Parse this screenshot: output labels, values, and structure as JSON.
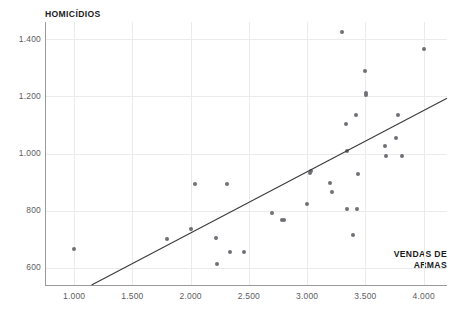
{
  "chart_data": {
    "type": "scatter",
    "title": "",
    "xlabel": "VENDAS DE ARMAS",
    "ylabel": "HOMICÍDIOS",
    "xlabel_lines": [
      "VENDAS DE",
      "ARMAS"
    ],
    "grid": true,
    "legend": false,
    "xlim": [
      750,
      4200
    ],
    "ylim": [
      540,
      1460
    ],
    "xticks": [
      1000,
      1500,
      2000,
      2500,
      3000,
      3500,
      4000
    ],
    "xtick_labels": [
      "1.000",
      "1.500",
      "2.000",
      "2.500",
      "3.000",
      "3.500",
      "4.000"
    ],
    "yticks": [
      600,
      800,
      1000,
      1200,
      1400
    ],
    "ytick_labels": [
      "600",
      "800",
      "1.000",
      "1.200",
      "1.400"
    ],
    "point_color": "#6f6f76",
    "trendline_color": "#3a3a3a",
    "gridline_color": "#ebebeb",
    "axis_color": "#9a9a9a",
    "label_color": "#5d5d62",
    "title_color": "#1b1b1b",
    "series": [
      {
        "name": "Estados",
        "points": [
          [
            1000,
            665
          ],
          [
            1800,
            702
          ],
          [
            2000,
            737
          ],
          [
            2040,
            895
          ],
          [
            2215,
            703
          ],
          [
            2225,
            613
          ],
          [
            2310,
            895
          ],
          [
            2340,
            657
          ],
          [
            2455,
            657
          ],
          [
            2700,
            793
          ],
          [
            2780,
            768
          ],
          [
            2800,
            767
          ],
          [
            3000,
            825
          ],
          [
            3020,
            933
          ],
          [
            3030,
            938
          ],
          [
            3200,
            896
          ],
          [
            3210,
            866
          ],
          [
            3300,
            1425
          ],
          [
            3330,
            1104
          ],
          [
            3340,
            806
          ],
          [
            3345,
            1008
          ],
          [
            3390,
            716
          ],
          [
            3420,
            1134
          ],
          [
            3430,
            805
          ],
          [
            3440,
            929
          ],
          [
            3500,
            1290
          ],
          [
            3505,
            1203
          ],
          [
            3505,
            1212
          ],
          [
            3670,
            1025
          ],
          [
            3680,
            990
          ],
          [
            3760,
            1053
          ],
          [
            3780,
            1136
          ],
          [
            3810,
            990
          ],
          [
            4000,
            1365
          ]
        ]
      }
    ],
    "trendline": {
      "type": "linear",
      "x_start": 1150,
      "y_start": 540,
      "x_end": 4200,
      "y_end": 1193
    }
  }
}
